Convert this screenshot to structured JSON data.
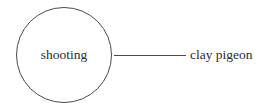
{
  "diagram": {
    "type": "concept-node-link",
    "width": 277,
    "height": 109,
    "background_color": "#ffffff",
    "stroke_color": "#4a4a4a",
    "text_color": "#2b2b2b",
    "center_node": {
      "label": "shooting",
      "shape": "circle",
      "cx": 64,
      "cy": 55,
      "r": 47.5,
      "stroke_width": 1,
      "fill": "#ffffff",
      "font_size": 13.5
    },
    "edges": [
      {
        "name": "shooting-to-clay-pigeon",
        "x1": 114,
        "y1": 55.5,
        "x2": 186,
        "y2": 55.5,
        "stroke_width": 1
      }
    ],
    "leaf_nodes": [
      {
        "label": "clay pigeon",
        "x": 190,
        "y": 55.5,
        "font_size": 13.5
      }
    ]
  }
}
